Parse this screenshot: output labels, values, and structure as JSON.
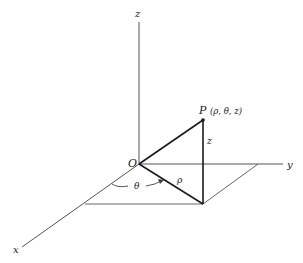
{
  "diagram": {
    "axes": {
      "x_label": "x",
      "y_label": "y",
      "z_label": "z",
      "origin_label": "O"
    },
    "point": {
      "name": "P",
      "coords": "(ρ, θ, z)"
    },
    "segment_labels": {
      "rho": "ρ",
      "height": "z",
      "angle": "θ"
    },
    "colors": {
      "axis": "#555555",
      "bold_line": "#1a1a1a",
      "thin_line": "#666666",
      "text": "#1a1a1a"
    }
  }
}
